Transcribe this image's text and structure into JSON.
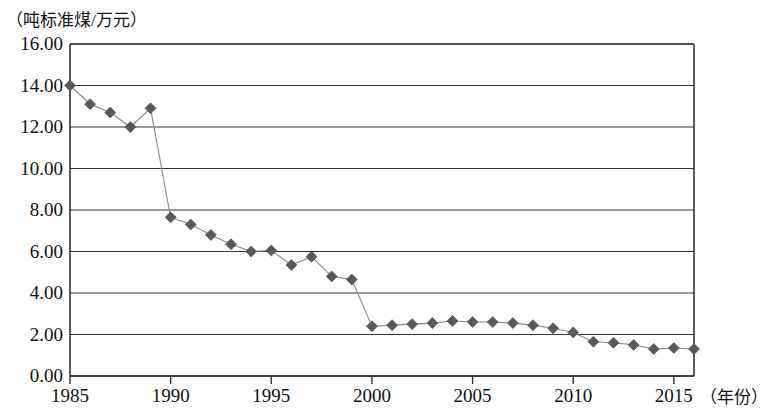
{
  "chart_data": {
    "type": "line",
    "title": "",
    "subtitle": "",
    "ylabel": "（吨标准煤/万元）",
    "xlabel": "（年份）",
    "xlim": [
      1985,
      2016
    ],
    "ylim": [
      0.0,
      16.0
    ],
    "grid": "horizontal",
    "legend": "none",
    "marker": "diamond",
    "marker_color": "#595959",
    "line_color": "#8a8a8a",
    "axis_color": "#333333",
    "y_ticks": [
      "0.00",
      "2.00",
      "4.00",
      "6.00",
      "8.00",
      "10.00",
      "12.00",
      "14.00",
      "16.00"
    ],
    "y_tick_values": [
      0,
      2,
      4,
      6,
      8,
      10,
      12,
      14,
      16
    ],
    "x_ticks": [
      "1985",
      "1990",
      "1995",
      "2000",
      "2005",
      "2010",
      "2015"
    ],
    "x_tick_values": [
      1985,
      1990,
      1995,
      2000,
      2005,
      2010,
      2015
    ],
    "x": [
      1985,
      1986,
      1987,
      1988,
      1989,
      1990,
      1991,
      1992,
      1993,
      1994,
      1995,
      1996,
      1997,
      1998,
      1999,
      2000,
      2001,
      2002,
      2003,
      2004,
      2005,
      2006,
      2007,
      2008,
      2009,
      2010,
      2011,
      2012,
      2013,
      2014,
      2015,
      2016
    ],
    "series": [
      {
        "name": "单位GDP能耗",
        "values": [
          14.0,
          13.1,
          12.7,
          12.0,
          12.9,
          7.65,
          7.3,
          6.8,
          6.35,
          6.0,
          6.05,
          5.35,
          5.75,
          4.8,
          4.65,
          2.4,
          2.45,
          2.5,
          2.55,
          2.65,
          2.6,
          2.6,
          2.55,
          2.45,
          2.3,
          2.1,
          1.65,
          1.6,
          1.5,
          1.3,
          1.35,
          1.3
        ]
      }
    ]
  }
}
